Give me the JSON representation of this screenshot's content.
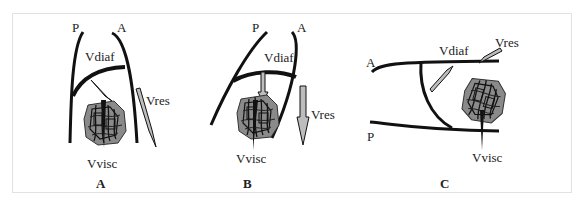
{
  "figure": {
    "panels": [
      {
        "id": "A",
        "caption": "A",
        "labels": {
          "posterior": "P",
          "anterior": "A",
          "diaphragm_vector": "Vdiaf",
          "resultant_vector": "Vres",
          "visceral_vector": "Vvisc"
        }
      },
      {
        "id": "B",
        "caption": "B",
        "labels": {
          "posterior": "P",
          "anterior": "A",
          "diaphragm_vector": "Vdiaf",
          "resultant_vector": "Vres",
          "visceral_vector": "Vvisc"
        }
      },
      {
        "id": "C",
        "caption": "C",
        "labels": {
          "posterior": "P",
          "anterior": "A",
          "diaphragm_vector": "Vdiaf",
          "resultant_vector": "Vres",
          "visceral_vector": "Vvisc"
        }
      }
    ],
    "colors": {
      "stroke": "#111111",
      "viscera_fill": "#8a8a8a",
      "arrow_fill": "#bdbdbd",
      "frame": "#e2e2e2"
    }
  }
}
